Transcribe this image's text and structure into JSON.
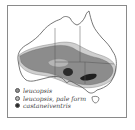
{
  "figure": {
    "type": "distribution map",
    "region": "Australia"
  },
  "legend": {
    "items": [
      {
        "label": "leucopsis",
        "color": "#8c8c8c"
      },
      {
        "label": "leucopsis, pale form",
        "color": "#b5b5b5"
      },
      {
        "label": "castaneiventris",
        "color": "#2a2a2a"
      }
    ]
  },
  "colors": {
    "outline": "#555555",
    "frame": "#8a8a8a",
    "range_main": "#8c8c8c",
    "range_pale": "#c8c8c8",
    "range_dark": "#2a2a2a",
    "background": "#ffffff"
  }
}
